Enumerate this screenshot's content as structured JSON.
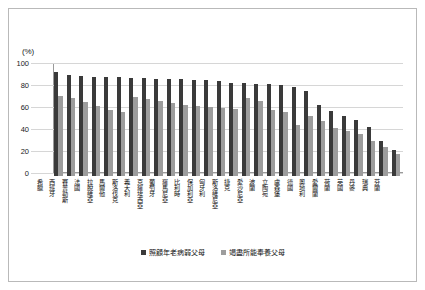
{
  "axis": {
    "y_unit_label": "(%)",
    "y_ticks": [
      "100",
      "80",
      "60",
      "40",
      "20",
      "0"
    ]
  },
  "legend": {
    "items": [
      {
        "label": "照顧年老病弱父母",
        "color": "#3a3a3a"
      },
      {
        "label": "竭盡所能奉養父母",
        "color": "#9d9d9d"
      }
    ]
  },
  "chart_data": {
    "type": "bar",
    "title": "",
    "xlabel": "",
    "ylabel": "(%)",
    "ylim": [
      0,
      100
    ],
    "grid": true,
    "legend_position": "bottom",
    "categories": [
      "希臘",
      "西班牙",
      "賽普勒斯",
      "法國",
      "拉脫維亞",
      "馬爾他",
      "斯洛伐克",
      "義大利",
      "克羅埃西亞",
      "葡萄牙",
      "羅馬尼亞",
      "比利時",
      "保加利亞",
      "匈牙利",
      "斯洛維尼亞",
      "捷克",
      "愛沙尼亞",
      "波蘭",
      "立陶宛",
      "盧森堡",
      "德國",
      "奧地利",
      "愛爾蘭",
      "荷蘭",
      "英國",
      "丹麥",
      "瑞典",
      "芬蘭"
    ],
    "series": [
      {
        "name": "照顧年老病弱父母",
        "color": "#3a3a3a",
        "values": [
          95,
          92,
          91,
          90,
          90,
          90,
          89,
          89,
          88,
          88,
          88,
          87,
          87,
          86,
          85,
          85,
          84,
          84,
          83,
          81,
          77,
          65,
          59,
          55,
          51,
          45,
          32,
          24
        ]
      },
      {
        "name": "竭盡所能奉養父母",
        "color": "#9d9d9d",
        "values": [
          73,
          71,
          67,
          64,
          60,
          58,
          72,
          70,
          68,
          66,
          65,
          64,
          63,
          62,
          61,
          71,
          68,
          60,
          58,
          46,
          55,
          50,
          44,
          41,
          38,
          32,
          26,
          20
        ]
      }
    ]
  }
}
